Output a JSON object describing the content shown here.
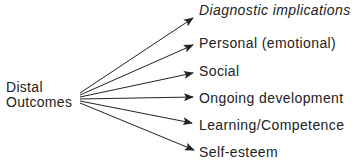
{
  "source": {
    "line1": "Distal",
    "line2": "Outcomes"
  },
  "targets": [
    {
      "label": "Diagnostic implications",
      "italic": true
    },
    {
      "label": "Personal (emotional)",
      "italic": false
    },
    {
      "label": "Social",
      "italic": false
    },
    {
      "label": "Ongoing development",
      "italic": false
    },
    {
      "label": "Learning/Competence",
      "italic": false
    },
    {
      "label": "Self-esteem",
      "italic": false
    }
  ],
  "colors": {
    "ink": "#222222",
    "background": "#ffffff"
  }
}
